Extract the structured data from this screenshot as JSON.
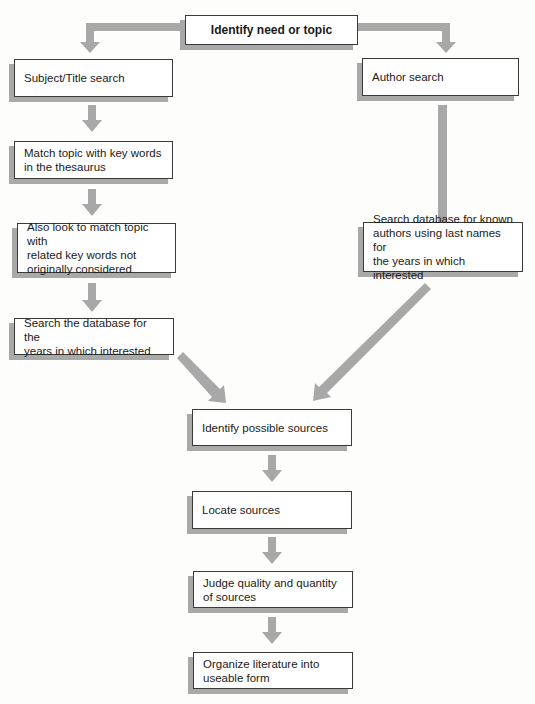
{
  "diagram": {
    "type": "flowchart",
    "colors": {
      "arrow": "#a8a8a8",
      "box_border": "#3a3a3a",
      "box_shadow": "#a9a9a9",
      "background": "#fdfdfc"
    },
    "nodes": {
      "start": {
        "label": "Identify need or topic"
      },
      "subject_search": {
        "label": "Subject/Title search"
      },
      "author_search": {
        "label": "Author search"
      },
      "match_thesaurus": {
        "label": "Match topic with key words\nin the thesaurus"
      },
      "related_keywords": {
        "label": "Also look to match topic with\nrelated key words not\noriginally considered"
      },
      "search_years": {
        "label": "Search the database for the\nyears in which interested"
      },
      "search_authors": {
        "label": "Search database for known\nauthors using last names for\nthe years in which interested"
      },
      "identify_sources": {
        "label": "Identify possible sources"
      },
      "locate_sources": {
        "label": "Locate sources"
      },
      "judge_sources": {
        "label": "Judge quality and quantity\nof sources"
      },
      "organize": {
        "label": "Organize literature into\nuseable form"
      }
    },
    "edges": [
      {
        "from": "start",
        "to": "subject_search"
      },
      {
        "from": "start",
        "to": "author_search"
      },
      {
        "from": "subject_search",
        "to": "match_thesaurus"
      },
      {
        "from": "match_thesaurus",
        "to": "related_keywords"
      },
      {
        "from": "related_keywords",
        "to": "search_years"
      },
      {
        "from": "author_search",
        "to": "search_authors"
      },
      {
        "from": "search_years",
        "to": "identify_sources"
      },
      {
        "from": "search_authors",
        "to": "identify_sources"
      },
      {
        "from": "identify_sources",
        "to": "locate_sources"
      },
      {
        "from": "locate_sources",
        "to": "judge_sources"
      },
      {
        "from": "judge_sources",
        "to": "organize"
      }
    ]
  }
}
